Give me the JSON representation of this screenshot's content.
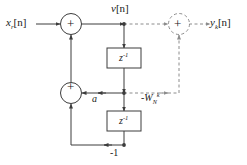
{
  "figure": {
    "type": "signal-flow-graph",
    "stroke_color": "#3c3c3c",
    "dashed_color": "#8c8c8c",
    "background": "#ffffff"
  },
  "labels": {
    "input": {
      "base": "x",
      "sub": "r",
      "bracket": "[n]"
    },
    "output": {
      "base": "y",
      "sub": "k",
      "bracket": "[n]"
    },
    "intermediate": {
      "base": "v",
      "bracket": "[n]"
    },
    "coefficient_a": "a",
    "twiddle": {
      "sign": "-",
      "base": "W",
      "sub": "N",
      "sup": "k"
    },
    "gain_minus_one": "-1",
    "delay_1": {
      "base": "z",
      "sup": "-1"
    },
    "delay_2": {
      "base": "z",
      "sup": "-1"
    }
  },
  "adders": [
    {
      "name": "input-adder",
      "sign": "+",
      "style": "solid"
    },
    {
      "name": "feedback-adder",
      "sign": "+",
      "style": "solid"
    },
    {
      "name": "output-adder",
      "sign": "+",
      "style": "dashed"
    }
  ],
  "blocks": [
    {
      "name": "delay-block-1",
      "label": "z^-1"
    },
    {
      "name": "delay-block-2",
      "label": "z^-1"
    }
  ]
}
